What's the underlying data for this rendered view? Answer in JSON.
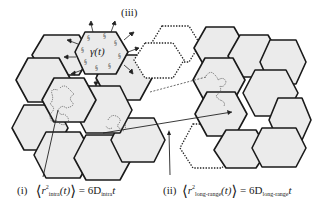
{
  "diagram": {
    "labels": {
      "region_iii": "(iii)",
      "region_i": "(i)",
      "region_ii": "(ii)",
      "gamma": "γ(t)"
    },
    "formulas": {
      "intra": {
        "lhs_symbol": "r",
        "lhs_sup": "2",
        "lhs_sub": "intra",
        "arg": "(t)",
        "rhs_coef": "= 6D",
        "rhs_sub": "intra",
        "rhs_var": "t"
      },
      "long_range": {
        "lhs_symbol": "r",
        "lhs_sup": "2",
        "lhs_sub": "long-range",
        "arg": "(t)",
        "rhs_coef": "= 6D",
        "rhs_sub": "long-range",
        "rhs_var": "t"
      }
    },
    "colors": {
      "hex_fill": "#ebebeb",
      "hex_stroke": "#1a1a1a",
      "dotted_stroke": "#222222"
    }
  }
}
